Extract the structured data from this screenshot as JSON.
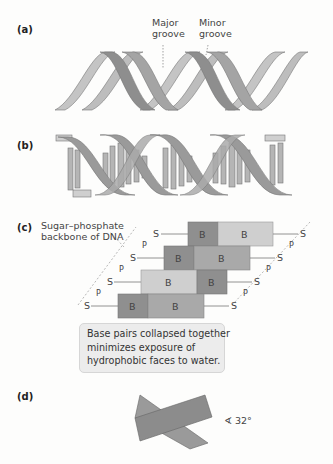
{
  "panels": {
    "a": {
      "label": "(a)",
      "major_groove_line1": "Major",
      "major_groove_line2": "groove",
      "minor_groove_line1": "Minor",
      "minor_groove_line2": "groove"
    },
    "b": {
      "label": "(b)"
    },
    "c": {
      "label": "(c)",
      "backbone_line1": "Sugar–phosphate",
      "backbone_line2": "backbone of DNA",
      "base_label": "B",
      "sugar_label": "S",
      "phosphate_label": "P",
      "note_line1": "Base pairs collapsed together",
      "note_line2": "minimizes exposure of",
      "note_line3": "hydrophobic faces to water."
    },
    "d": {
      "label": "(d)",
      "angle": "∢ 32°"
    }
  },
  "colors": {
    "strand_light": "#b8b8b8",
    "strand_dark": "#8a8a8a",
    "base_dark": "#8f8f8f",
    "base_mid": "#a9a9a9",
    "base_light": "#cfcfcf",
    "note_bg": "#ececec"
  }
}
